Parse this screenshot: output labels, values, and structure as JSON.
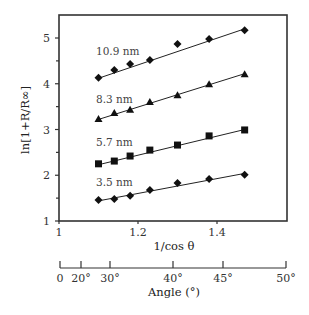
{
  "chart_data": {
    "type": "scatter",
    "title": "",
    "xlabel": "1/cos θ",
    "ylabel": "ln[1+R/R∞]",
    "xlim": [
      1.0,
      1.58
    ],
    "ylim": [
      1.0,
      5.5
    ],
    "x_ticks": [
      1,
      1.2,
      1.4
    ],
    "x_tick_labels": [
      "1",
      "1.2",
      "1.4"
    ],
    "y_ticks": [
      1,
      2,
      3,
      4,
      5
    ],
    "y_tick_labels": [
      "1",
      "2",
      "3",
      "4",
      "5"
    ],
    "y_minor_ticks": [
      1.5,
      2.5,
      3.5,
      4.5
    ],
    "grid": false,
    "legend": "inline labels next to each series",
    "x": [
      1.1,
      1.14,
      1.18,
      1.23,
      1.3,
      1.38,
      1.47
    ],
    "series": [
      {
        "name": "10.9 nm",
        "marker": "diamond",
        "values": [
          4.13,
          4.3,
          4.43,
          4.52,
          4.87,
          4.98,
          5.17
        ],
        "fit": [
          4.12,
          5.2
        ]
      },
      {
        "name": "8.3 nm",
        "marker": "triangle",
        "values": [
          3.23,
          3.36,
          3.43,
          3.6,
          3.75,
          3.99,
          4.21
        ],
        "fit": [
          3.22,
          4.22
        ]
      },
      {
        "name": "5.7 nm",
        "marker": "square",
        "values": [
          2.25,
          2.31,
          2.42,
          2.55,
          2.66,
          2.86,
          2.99
        ],
        "fit": [
          2.23,
          3.0
        ]
      },
      {
        "name": "3.5 nm",
        "marker": "diamond",
        "values": [
          1.46,
          1.48,
          1.55,
          1.68,
          1.83,
          1.92,
          2.01
        ],
        "fit": [
          1.44,
          2.04
        ]
      }
    ],
    "secondary_axis": {
      "label": "Angle (°)",
      "ticks": [
        0,
        20,
        30,
        40,
        45,
        50
      ],
      "tick_labels": [
        "0",
        "20°",
        "30°",
        "40°",
        "45°",
        "50°"
      ]
    }
  },
  "labels": {
    "y_title": "ln[1+R/R∞]",
    "x_title": "1/cos θ",
    "angle_title": "Angle (°)"
  }
}
